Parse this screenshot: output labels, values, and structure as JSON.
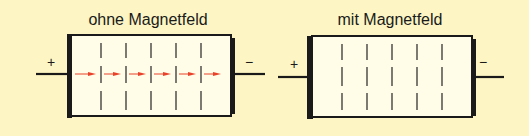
{
  "background_color": "#fdf6c4",
  "box_fill": "#fffde8",
  "line_color": "#1a1a1a",
  "arrow_color": "#e8432a",
  "diagrams": [
    {
      "id": "without-field",
      "title": "ohne Magnetfeld",
      "plus_label": "+",
      "minus_label": "−",
      "has_current_arrows": true
    },
    {
      "id": "with-field",
      "title": "mit Magnetfeld",
      "plus_label": "+",
      "minus_label": "−",
      "has_current_arrows": false
    }
  ]
}
